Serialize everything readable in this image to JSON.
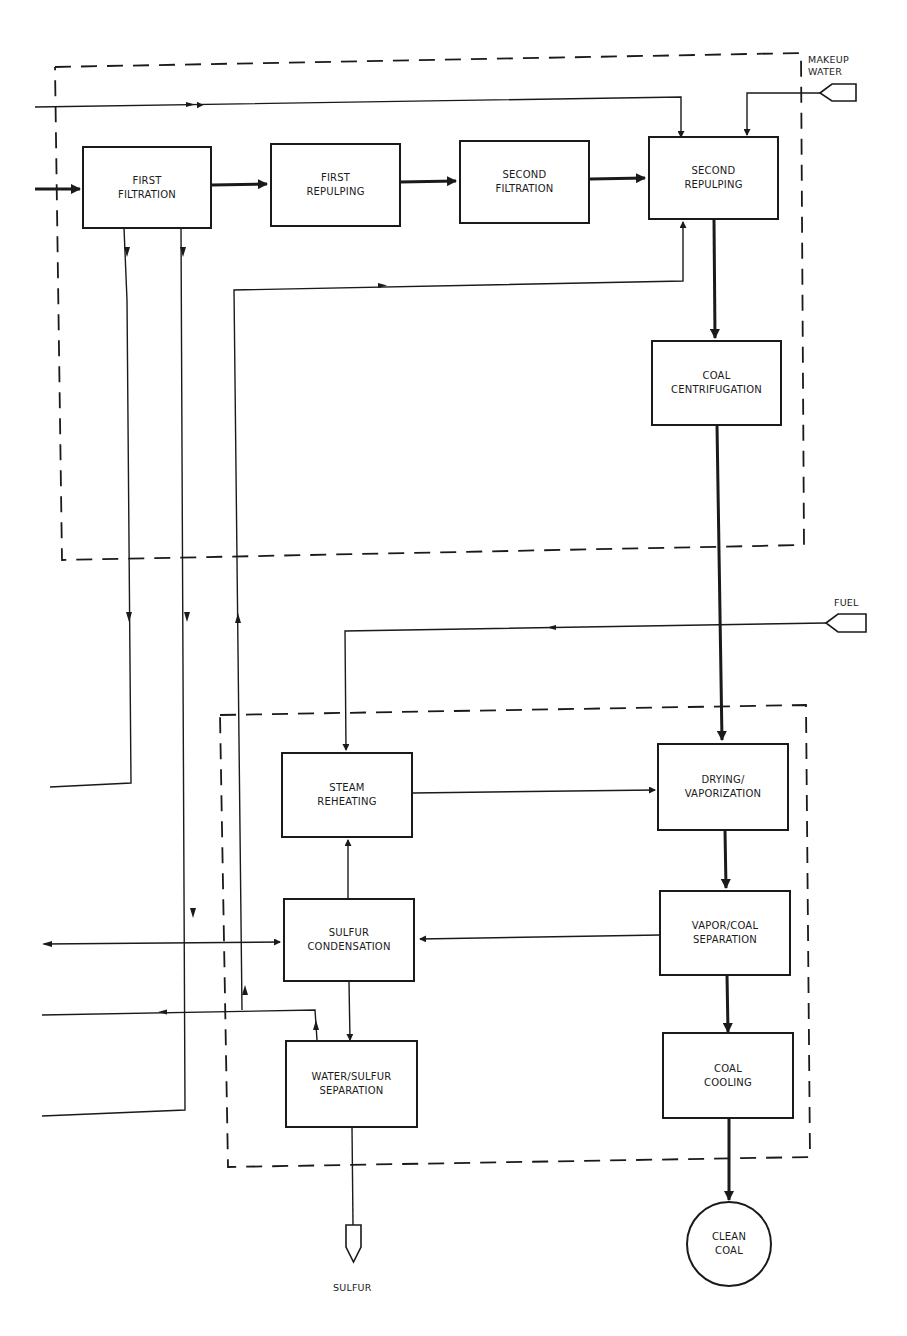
{
  "diagram": {
    "type": "process-flow",
    "colors": {
      "line": "#1a1a1a",
      "background": "#ffffff"
    },
    "process_boxes": {
      "first_filtration": "FIRST\nFILTRATION",
      "first_repulping": "FIRST\nREPULPING",
      "second_filtration": "SECOND\nFILTRATION",
      "second_repulping": "SECOND\nREPULPING",
      "coal_centrifugation": "COAL\nCENTRIFUGATION",
      "steam_reheating": "STEAM\nREHEATING",
      "drying_vaporization": "DRYING/\nVAPORIZATION",
      "sulfur_condensation": "SULFUR\nCONDENSATION",
      "vapor_coal_separation": "VAPOR/COAL\nSEPARATION",
      "water_sulfur_separation": "WATER/SULFUR\nSEPARATION",
      "coal_cooling": "COAL\nCOOLING"
    },
    "terminals": {
      "makeup_water": "MAKEUP\nWATER",
      "fuel": "FUEL",
      "sulfur": "SULFUR",
      "clean_coal": "CLEAN\nCOAL"
    },
    "groups": [
      {
        "id": "filtration-repulping-section",
        "style": "dashed"
      },
      {
        "id": "drying-condensation-section",
        "style": "dashed"
      }
    ],
    "flows": [
      {
        "from": "external-left",
        "to": "First Filtration",
        "weight": "heavy"
      },
      {
        "from": "First Filtration",
        "to": "First Repulping",
        "weight": "heavy"
      },
      {
        "from": "First Repulping",
        "to": "Second Filtration",
        "weight": "heavy"
      },
      {
        "from": "Second Filtration",
        "to": "Second Repulping",
        "weight": "heavy"
      },
      {
        "from": "Second Repulping",
        "to": "Coal Centrifugation",
        "weight": "heavy"
      },
      {
        "from": "Coal Centrifugation",
        "to": "Drying/Vaporization",
        "weight": "heavy"
      },
      {
        "from": "Drying/Vaporization",
        "to": "Vapor/Coal Separation",
        "weight": "heavy"
      },
      {
        "from": "Vapor/Coal Separation",
        "to": "Coal Cooling",
        "weight": "heavy"
      },
      {
        "from": "Coal Cooling",
        "to": "Clean Coal",
        "weight": "heavy"
      },
      {
        "from": "Makeup Water",
        "to": "Second Repulping",
        "weight": "light"
      },
      {
        "from": "external-left (top)",
        "to": "Second Repulping",
        "weight": "light"
      },
      {
        "from": "Fuel",
        "to": "Steam Reheating",
        "weight": "light"
      },
      {
        "from": "Steam Reheating",
        "to": "Drying/Vaporization",
        "weight": "light"
      },
      {
        "from": "Vapor/Coal Separation",
        "to": "Sulfur Condensation",
        "weight": "light"
      },
      {
        "from": "Sulfur Condensation",
        "to": "Steam Reheating",
        "weight": "light"
      },
      {
        "from": "Sulfur Condensation",
        "to": "Water/Sulfur Separation",
        "weight": "light"
      },
      {
        "from": "Water/Sulfur Separation",
        "to": "Sulfur",
        "weight": "light"
      },
      {
        "from": "Water/Sulfur Separation",
        "to": "Second Repulping (recycle)",
        "weight": "light"
      },
      {
        "from": "First Filtration",
        "to": "external-left (lower)",
        "weight": "light"
      },
      {
        "from": "external-left (middle)",
        "to": "Sulfur Condensation",
        "weight": "light"
      }
    ]
  }
}
